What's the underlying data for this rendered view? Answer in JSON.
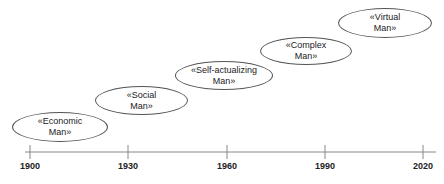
{
  "diagram": {
    "type": "timeline",
    "axis": {
      "ticks": [
        {
          "label": "1900",
          "x": 30
        },
        {
          "label": "1930",
          "x": 128
        },
        {
          "label": "1960",
          "x": 227
        },
        {
          "label": "1990",
          "x": 325
        },
        {
          "label": "2020",
          "x": 423
        }
      ]
    },
    "stages": [
      {
        "line1": "«Economic",
        "line2": "Man»",
        "left": 12,
        "top": 112,
        "width": 96,
        "height": 30
      },
      {
        "line1": "«Social",
        "line2": "Man»",
        "left": 95,
        "top": 86,
        "width": 93,
        "height": 29
      },
      {
        "line1": "«Self-actualizing",
        "line2": "Man»",
        "left": 175,
        "top": 61,
        "width": 98,
        "height": 29
      },
      {
        "line1": "«Complex",
        "line2": "Man»",
        "left": 260,
        "top": 37,
        "width": 92,
        "height": 28
      },
      {
        "line1": "«Virtual",
        "line2": "Man»",
        "left": 338,
        "top": 8,
        "width": 94,
        "height": 30
      }
    ],
    "colors": {
      "line": "#888888",
      "ellipse_border": "#555555",
      "text": "#222222"
    }
  }
}
